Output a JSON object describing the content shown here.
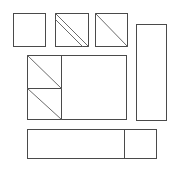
{
  "figure": {
    "canvas": {
      "width": 178,
      "height": 169,
      "background": "#ffffff"
    },
    "stroke_color": "#4a4a4a",
    "diagonal_color": "#6b6b6b",
    "fill_color": "#ffffff",
    "stroke_width": 1,
    "shapes": [
      {
        "id": "square-plain",
        "label": "Plain square",
        "x": 13,
        "y": 13,
        "width": 32,
        "height": 33,
        "diagonals": []
      },
      {
        "id": "square-double-diagonal",
        "label": "Square with two parallel diagonals",
        "x": 55,
        "y": 13,
        "width": 33,
        "height": 33,
        "diagonals": [
          {
            "x1": 55,
            "y1": 13,
            "x2": 88,
            "y2": 46
          },
          {
            "x1": 55,
            "y1": 19,
            "x2": 82,
            "y2": 46
          }
        ]
      },
      {
        "id": "square-single-diagonal",
        "label": "Square with one diagonal",
        "x": 95,
        "y": 13,
        "width": 32,
        "height": 33,
        "diagonals": [
          {
            "x1": 95,
            "y1": 13,
            "x2": 127,
            "y2": 46
          }
        ]
      },
      {
        "id": "tall-rectangle",
        "label": "Tall vertical rectangle",
        "x": 136,
        "y": 24,
        "width": 30,
        "height": 96,
        "diagonals": []
      },
      {
        "id": "central-block",
        "label": "Central large rectangle",
        "x": 27,
        "y": 55,
        "width": 99,
        "height": 64,
        "diagonals": []
      },
      {
        "id": "bottom-block",
        "label": "Bottom wide rectangle",
        "x": 27,
        "y": 129,
        "width": 129,
        "height": 29,
        "diagonals": []
      }
    ],
    "dividers": [
      {
        "id": "central-vertical-divider",
        "label": "Vertical divider in central block",
        "x1": 61,
        "y1": 55,
        "x2": 61,
        "y2": 119
      },
      {
        "id": "central-horizontal-divider",
        "label": "Horizontal divider in central left column",
        "x1": 27,
        "y1": 88,
        "x2": 61,
        "y2": 88
      },
      {
        "id": "bottom-vertical-divider",
        "label": "Vertical divider in bottom block",
        "x1": 124,
        "y1": 129,
        "x2": 124,
        "y2": 158
      }
    ],
    "cell_diagonals": [
      {
        "id": "central-cell-upper-diagonal",
        "label": "Diagonal in upper left cell",
        "x1": 27,
        "y1": 55,
        "x2": 61,
        "y2": 88
      },
      {
        "id": "central-cell-lower-diagonal",
        "label": "Diagonal in lower left cell",
        "x1": 27,
        "y1": 88,
        "x2": 61,
        "y2": 119
      }
    ]
  }
}
